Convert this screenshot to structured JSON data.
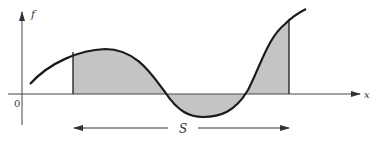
{
  "diagram": {
    "type": "function-area-diagram",
    "y_axis_label": "f",
    "x_axis_label": "x",
    "origin_label": "0",
    "interval_label": "S",
    "colors": {
      "curve": "#1a1a1a",
      "shade": "#c4c4c4",
      "axis": "#333333"
    }
  }
}
